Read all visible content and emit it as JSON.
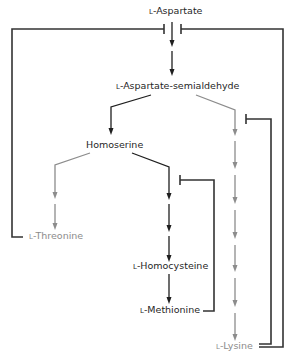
{
  "diagram": {
    "colors": {
      "active_path": "#1f1f1f",
      "inactive_path": "#8c8c8c",
      "feedback_line": "#333333"
    },
    "nodes": {
      "aspartate": {
        "prefix": "L",
        "name": "-Aspartate"
      },
      "semialdehyde": {
        "prefix": "L",
        "name": "-Aspartate-semialdehyde"
      },
      "homoserine": {
        "prefix": "",
        "name": "Homoserine"
      },
      "threonine": {
        "prefix": "L",
        "name": "-Threonine"
      },
      "homocysteine": {
        "prefix": "L",
        "name": "-Homocysteine"
      },
      "methionine": {
        "prefix": "L",
        "name": "-Methionine"
      },
      "lysine": {
        "prefix": "L",
        "name": "-Lysine"
      }
    },
    "edges": [
      {
        "from": "L-Aspartate",
        "to": "L-Aspartate-semialdehyde",
        "steps": 2,
        "style": "dark"
      },
      {
        "from": "L-Aspartate-semialdehyde",
        "to": "Homoserine",
        "steps": 1,
        "style": "dark"
      },
      {
        "from": "L-Aspartate-semialdehyde",
        "to": "L-Lysine",
        "steps": 7,
        "style": "gray"
      },
      {
        "from": "Homoserine",
        "to": "L-Threonine",
        "steps": 2,
        "style": "gray"
      },
      {
        "from": "Homoserine",
        "to": "L-Homocysteine",
        "steps": 3,
        "style": "dark"
      },
      {
        "from": "L-Homocysteine",
        "to": "L-Methionine",
        "steps": 1,
        "style": "dark"
      }
    ],
    "feedback_inhibition": [
      {
        "from": "L-Threonine",
        "target": "L-Aspartate step 1 (left)"
      },
      {
        "from": "L-Lysine",
        "target": "L-Aspartate step 1 (right)"
      },
      {
        "from": "L-Lysine",
        "target": "Lysine branch first step"
      },
      {
        "from": "L-Methionine",
        "target": "Methionine branch first step"
      }
    ]
  }
}
